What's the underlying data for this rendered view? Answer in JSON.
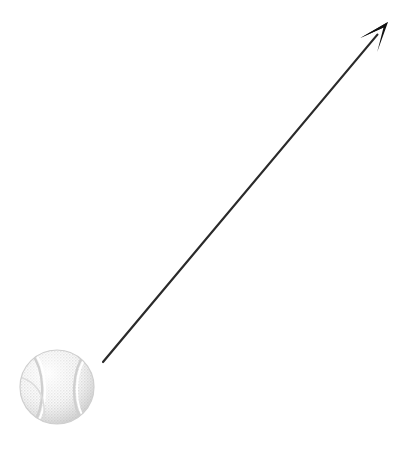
{
  "canvas": {
    "width": 419,
    "height": 449,
    "background_color": "#ffffff",
    "title": "Tennis ball with motion direction arrow"
  },
  "objects": {
    "ball": {
      "label": "tennis ball",
      "center_x": 57,
      "center_y": 387,
      "radius": 37,
      "fill_color": "#f2f2f2",
      "shade_color": "#d8d8d8",
      "seam_color": "#e2e2e2",
      "texture": "halftone-dither",
      "outline_color": "#cfcfcf"
    },
    "arrow": {
      "label": "direction arrow",
      "tail_x": 103,
      "tail_y": 362,
      "tip_x": 388,
      "tip_y": 22,
      "stroke_color": "#2a2a2a",
      "stroke_width": 2.2,
      "head_length": 30,
      "head_half_width": 11,
      "head_notch": 7,
      "head_fill_color": "#121212",
      "angle_degrees": -50
    }
  }
}
